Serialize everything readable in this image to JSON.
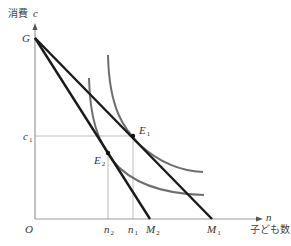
{
  "diagram": {
    "y_axis": {
      "label": "消費",
      "symbol": "c"
    },
    "x_axis": {
      "label": "子ども数",
      "symbol": "n"
    },
    "origin": "O",
    "intercept_point": "G",
    "points": {
      "E1": {
        "main": "E",
        "sub": "1"
      },
      "E2": {
        "main": "E",
        "sub": "2"
      }
    },
    "x_ticks": {
      "n2": {
        "main": "n",
        "sub": "2"
      },
      "n1": {
        "main": "n",
        "sub": "1"
      },
      "M2": {
        "main": "M",
        "sub": "2"
      },
      "M1": {
        "main": "M",
        "sub": "1"
      }
    },
    "y_ticks": {
      "c1": {
        "main": "c",
        "sub": "1"
      }
    },
    "colors": {
      "budget_line": "#1a1a1a",
      "indifference_curve": "#6e6e6e",
      "guide_line": "#bdbdbd",
      "axis": "#9a9a9a"
    },
    "elements": [
      {
        "type": "budget_line",
        "from": "G",
        "to": "M1",
        "tangent_at": "E1"
      },
      {
        "type": "budget_line",
        "from": "G",
        "to": "M2",
        "tangent_at": "E2"
      },
      {
        "type": "indifference_curve",
        "through": "E1",
        "level": "outer"
      },
      {
        "type": "indifference_curve",
        "through": "E2",
        "level": "inner"
      }
    ]
  }
}
